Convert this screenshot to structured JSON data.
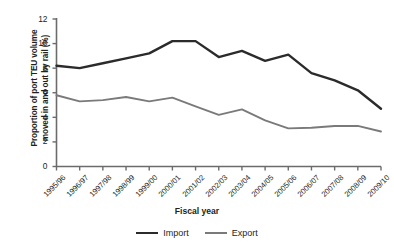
{
  "chart_data": {
    "type": "line",
    "title": "",
    "xlabel": "Fiscal year",
    "ylabel": "Proportion of port TEU volume moved in and out by rail (%)",
    "ylabel_lines": [
      "Proportion of port TEU volume",
      "moved in and out by rail (%)"
    ],
    "categories": [
      "1995/96",
      "1996/97",
      "1997/98",
      "1998/99",
      "1999/00",
      "2000/01",
      "2001/02",
      "2002/03",
      "2003/04",
      "2004/05",
      "2005/06",
      "2006/07",
      "2007/08",
      "2008/09",
      "2009/10"
    ],
    "series": [
      {
        "name": "Import",
        "color": "#2b2b2b",
        "values": [
          8.2,
          8.0,
          8.4,
          8.8,
          9.2,
          10.2,
          10.2,
          8.9,
          9.4,
          8.6,
          9.1,
          7.6,
          7.0,
          6.2,
          4.7
        ]
      },
      {
        "name": "Export",
        "color": "#7a7a7a",
        "values": [
          5.8,
          5.3,
          5.4,
          5.65,
          5.3,
          5.6,
          4.9,
          4.2,
          4.65,
          3.75,
          3.1,
          3.15,
          3.3,
          3.3,
          2.85
        ]
      }
    ],
    "ylim": [
      0,
      12
    ],
    "yticks": [
      0,
      2,
      4,
      6,
      8,
      10,
      12
    ],
    "ytick_labels": [
      "0",
      "2",
      "4",
      "6",
      "8",
      "10",
      "12"
    ],
    "grid": false,
    "legend_position": "bottom"
  },
  "legend": {
    "items": [
      {
        "label": "Import",
        "color": "#2b2b2b"
      },
      {
        "label": "Export",
        "color": "#7a7a7a"
      }
    ]
  }
}
